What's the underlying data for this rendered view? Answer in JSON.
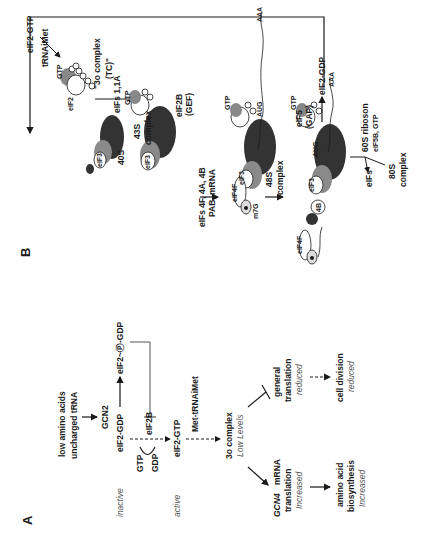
{
  "figure": {
    "orientation": "rotated 90 degrees counter-clockwise",
    "panel_a": {
      "label": "A",
      "stress_input": [
        "low amino acids",
        "uncharged tRNA"
      ],
      "kinase": "GCN2",
      "inactive_state": "inactive",
      "eif2_gdp": "eIF2-GDP",
      "phospho_product": "eIF2~Ⓟ-GDP",
      "gef": "eIF2B",
      "gtp": "GTP",
      "gdp": "GDP",
      "active_state": "active",
      "eif2_gtp": "eIF2-GTP",
      "met_trna": "Met-tRNAiMet",
      "ternary_complex": "3o complex",
      "ternary_level": "Low Levels",
      "gcn4_gene": "GCN4",
      "gcn4_label": "mRNA",
      "gcn4_line2": "translation",
      "gcn4_effect": "Increased",
      "biosynthesis_line1": "amino acid",
      "biosynthesis_line2": "biosynthesis",
      "biosynthesis_effect": "Increased",
      "general_line1": "general",
      "general_line2": "translation",
      "general_effect": "reduced",
      "division": "cell division",
      "division_effect": "reduced"
    },
    "panel_b": {
      "label": "B",
      "eif2_gtp": "eIF2-GTP",
      "trna": "tRNAiMet",
      "eif2": "eIF2",
      "gtp": "GTP",
      "tc_line1": "\"3o complex",
      "tc_line2": "(TC)\"",
      "eif3": "eIF3",
      "s40": "40S",
      "eifs_11a": "eIFs 1,1A",
      "s43_line1": "43S",
      "s43_line2": "complex",
      "eifs_4f_line1": "eIFs 4F, 4A, 4B",
      "eifs_4f_line2": "PAB, mRNA",
      "eif2b_line1": "eIF2B",
      "eif2b_line2": "(GEF)",
      "eif4f": "eIF4F",
      "m7g": "m7G",
      "aug": "AUG",
      "aaa": "AAA",
      "s48_line1": "48S",
      "s48_line2": "complex",
      "eif5_line1": "eIF5",
      "eif5_line2": "(GAP)",
      "eif2_gdp": "eIF2-GDP",
      "b4": "4B",
      "a4": "4A",
      "eifs": "eIFs",
      "s60_line1": "60S riboson",
      "s60_line2": "eIF5B, GTP",
      "s80_line1": "80S",
      "s80_line2": "complex"
    }
  },
  "colors": {
    "ink": "#1a1a1a",
    "ribosome_dark": "#333333",
    "ribosome_mid": "#8a8a8a",
    "light_fill": "#e6e6e6",
    "grey_text": "#555555"
  }
}
